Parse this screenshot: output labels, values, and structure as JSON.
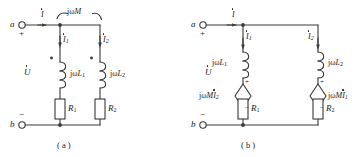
{
  "figure": {
    "caption_a": "( a )",
    "caption_b": "( b )"
  },
  "circuit_a": {
    "name": "coupled-inductors-mutual-inductance",
    "terminal_top": "a",
    "terminal_bottom": "b",
    "polarity_plus": "+",
    "polarity_minus": "−",
    "source_label": "U",
    "current_total": "I",
    "current_branch1": "I",
    "current_branch1_sub": "1",
    "current_branch2": "I",
    "current_branch2_sub": "2",
    "mutual_label_j": "j",
    "mutual_label_w": "ω",
    "mutual_label_M": "M",
    "ind1_j": "j",
    "ind1_w": "ω",
    "ind1_L": "L",
    "ind1_sub": "1",
    "ind2_j": "j",
    "ind2_w": "ω",
    "ind2_L": "L",
    "ind2_sub": "2",
    "res1": "R",
    "res1_sub": "1",
    "res2": "R",
    "res2_sub": "2",
    "dot_marker": "dot"
  },
  "circuit_b": {
    "name": "decoupled-equivalent-dependent-sources",
    "terminal_top": "a",
    "terminal_bottom": "b",
    "polarity_plus": "+",
    "polarity_minus": "−",
    "source_label": "U",
    "current_total": "I",
    "current_branch1": "I",
    "current_branch1_sub": "1",
    "current_branch2": "I",
    "current_branch2_sub": "2",
    "ind1_j": "j",
    "ind1_w": "ω",
    "ind1_L": "L",
    "ind1_sub": "1",
    "ind2_j": "j",
    "ind2_w": "ω",
    "ind2_L": "L",
    "ind2_sub": "2",
    "dep1_j": "j",
    "dep1_w": "ω",
    "dep1_M": "M",
    "dep1_I": "I",
    "dep1_sub": "2",
    "dep1_plus": "+",
    "dep1_minus": "−",
    "dep2_j": "j",
    "dep2_w": "ω",
    "dep2_M": "M",
    "dep2_I": "I",
    "dep2_sub": "1",
    "dep2_plus": "+",
    "dep2_minus": "−",
    "res1": "R",
    "res1_sub": "1",
    "res2": "R",
    "res2_sub": "2"
  },
  "style": {
    "wire_color": "#3a3a3a",
    "text_color": "#1a1a1a",
    "background": "#ffffff"
  }
}
